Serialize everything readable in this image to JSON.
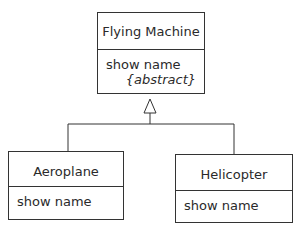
{
  "classes": {
    "parent": {
      "name": "Flying Machine",
      "operation": "show name",
      "constraint": "{abstract}"
    },
    "child_left": {
      "name": "Aeroplane",
      "operation": "show name"
    },
    "child_right": {
      "name": "Helicopter",
      "operation": "show name"
    }
  },
  "relationship": "generalization"
}
